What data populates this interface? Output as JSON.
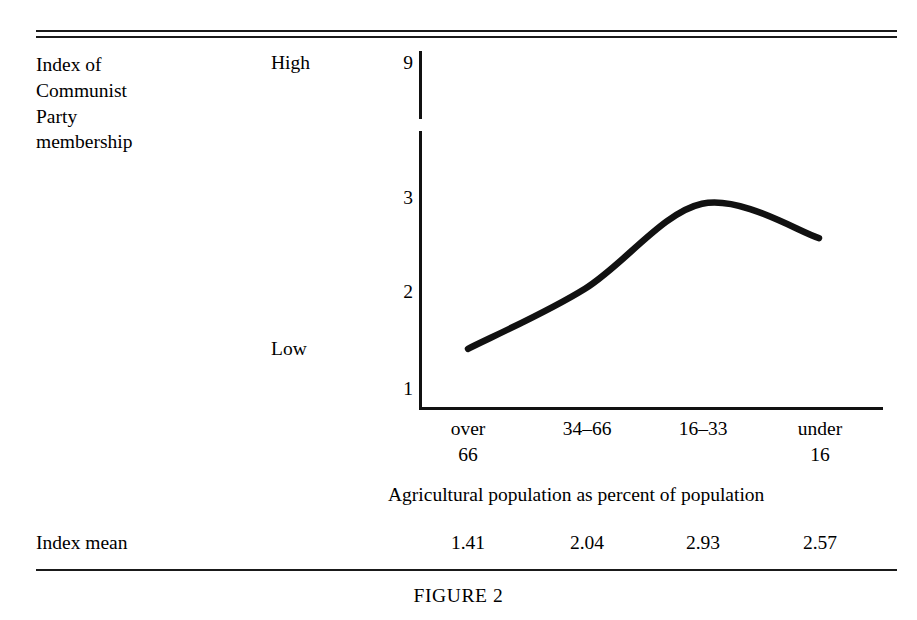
{
  "figure": {
    "caption": "FIGURE 2",
    "stub_label": "Index of\nCommunist\nParty\nmembership",
    "high_label": "High",
    "low_label": "Low",
    "axis_title": "Agricultural population as percent of population",
    "mean_row_label": "Index mean"
  },
  "chart_data": {
    "type": "line",
    "title": "FIGURE 2",
    "xlabel": "Agricultural population as percent of population",
    "ylabel": "Index of Communist Party membership",
    "categories": [
      "over 66",
      "34–66",
      "16–33",
      "under 16"
    ],
    "category_lines": [
      {
        "l1": "over",
        "l2": "66"
      },
      {
        "l1": "34–66",
        "l2": ""
      },
      {
        "l1": "16–33",
        "l2": ""
      },
      {
        "l1": "under",
        "l2": "16"
      }
    ],
    "values": [
      1.41,
      2.04,
      2.93,
      2.57
    ],
    "value_labels": [
      "1.41",
      "2.04",
      "2.93",
      "2.57"
    ],
    "ytick_labels": [
      "9",
      "3",
      "2",
      "1"
    ],
    "ytick_values": [
      9,
      3,
      2,
      1
    ],
    "y_axis_broken": true,
    "ylim": [
      1,
      3
    ],
    "grid": false,
    "legend": "none",
    "anchors": {
      "high": "High",
      "low": "Low"
    },
    "line_color": "#111111"
  }
}
